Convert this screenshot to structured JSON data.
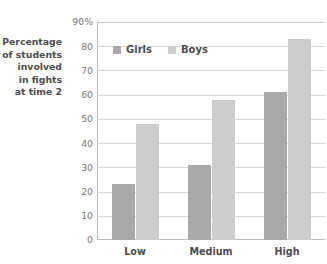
{
  "chart_data": {
    "type": "bar",
    "title": "",
    "xlabel": "",
    "ylabel": "Percentage of students involved in fights at time 2",
    "ylabel_lines": [
      "Percentage",
      "of students",
      "involved",
      "in fights",
      "at time 2"
    ],
    "categories": [
      "Low",
      "Medium",
      "High"
    ],
    "series": [
      {
        "name": "Girls",
        "color": "#a9a9a9",
        "values": [
          23,
          31,
          61
        ]
      },
      {
        "name": "Boys",
        "color": "#cdcdcd",
        "values": [
          48,
          58,
          83
        ]
      }
    ],
    "ylim": [
      0,
      90
    ],
    "ytick_values": [
      0,
      10,
      20,
      30,
      40,
      50,
      60,
      70,
      80,
      90
    ],
    "ytick_labels": [
      "0",
      "10",
      "20",
      "30",
      "40",
      "50",
      "60",
      "70",
      "80",
      "90%"
    ],
    "grid": true,
    "legend_position": "inside-top-left"
  },
  "legend": {
    "entries": [
      {
        "label": "Girls",
        "swatch": "girls-swatch-icon"
      },
      {
        "label": "Boys",
        "swatch": "boys-swatch-icon"
      }
    ]
  },
  "colors": {
    "girls": "#a9a9a9",
    "boys": "#cdcdcd",
    "grid": "#d7d7d7",
    "axis": "#bdbdbd",
    "text": "#4d4d4d",
    "tick_text": "#7a7a7a",
    "background": "#ffffff"
  }
}
